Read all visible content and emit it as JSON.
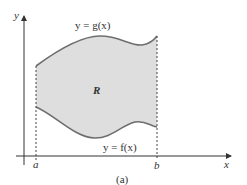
{
  "diagram": {
    "axes": {
      "x_label": "x",
      "y_label": "y"
    },
    "bounds": {
      "left_label": "a",
      "right_label": "b"
    },
    "curves": {
      "upper": {
        "label": "y = g(x)"
      },
      "lower": {
        "label": "y = f(x)"
      }
    },
    "region_label": "R",
    "caption": "(a)",
    "colors": {
      "region_fill": "#dedede",
      "curve_stroke": "#6e6e6e",
      "axis_stroke": "#333333"
    }
  }
}
